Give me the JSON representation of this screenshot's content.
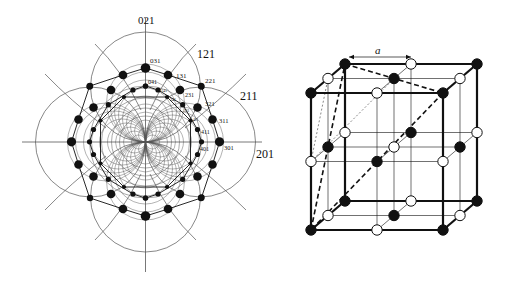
{
  "stereogram": {
    "center": [
      145.5,
      142
    ],
    "axis_labels": [
      {
        "text": "021",
        "x": 138,
        "y": 24,
        "size": 11
      },
      {
        "text": "121",
        "x": 197,
        "y": 58,
        "size": 12
      },
      {
        "text": "211",
        "x": 240,
        "y": 100,
        "size": 12
      },
      {
        "text": "201",
        "x": 256,
        "y": 158,
        "size": 12
      }
    ],
    "pole_labels": [
      {
        "text": "031",
        "x": 150,
        "y": 63,
        "size": 7
      },
      {
        "text": "131",
        "x": 176,
        "y": 78,
        "size": 7
      },
      {
        "text": "041",
        "x": 148,
        "y": 84,
        "size": 6
      },
      {
        "text": "221",
        "x": 205,
        "y": 83,
        "size": 7
      },
      {
        "text": "141",
        "x": 161,
        "y": 92,
        "size": 4
      },
      {
        "text": "231",
        "x": 185,
        "y": 97,
        "size": 6
      },
      {
        "text": "241",
        "x": 170,
        "y": 101,
        "size": 4
      },
      {
        "text": "321",
        "x": 205,
        "y": 106,
        "size": 6.5
      },
      {
        "text": "331",
        "x": 184,
        "y": 112,
        "size": 3.5
      },
      {
        "text": "421",
        "x": 193,
        "y": 121,
        "size": 3.5
      },
      {
        "text": "311",
        "x": 219,
        "y": 123,
        "size": 6.5
      },
      {
        "text": "411",
        "x": 201,
        "y": 134,
        "size": 6
      },
      {
        "text": "401",
        "x": 200,
        "y": 151,
        "size": 6
      },
      {
        "text": "301",
        "x": 224,
        "y": 150,
        "size": 6.5
      }
    ],
    "poles_first_octant": [
      {
        "id": "031",
        "x": 145.7,
        "y": 68,
        "r": 4.6
      },
      {
        "id": "041",
        "x": 145.7,
        "y": 86,
        "r": 2.6
      },
      {
        "id": "131",
        "x": 168,
        "y": 75,
        "r": 4.3
      },
      {
        "id": "141",
        "x": 158,
        "y": 90,
        "r": 2.6
      },
      {
        "id": "221",
        "x": 201,
        "y": 86,
        "r": 3.2
      },
      {
        "id": "231",
        "x": 180,
        "y": 90,
        "r": 4.3
      },
      {
        "id": "241",
        "x": 167,
        "y": 97,
        "r": 2.1
      },
      {
        "id": "331",
        "x": 182.7,
        "y": 104.7,
        "r": 2.6
      }
    ],
    "colors": {
      "ink": "#111111",
      "line": "#555555"
    }
  },
  "cube": {
    "label": "a",
    "colors": {
      "black_atom": "#111111",
      "white_atom": "#ffffff",
      "edge": "#111111"
    }
  }
}
